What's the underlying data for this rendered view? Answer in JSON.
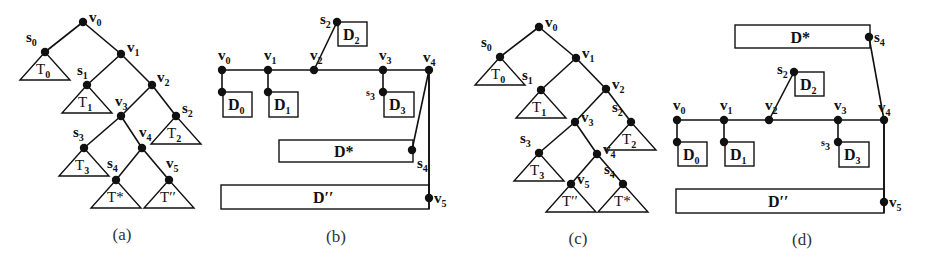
{
  "figure": {
    "panels": [
      {
        "id": "a",
        "type": "tree",
        "caption": "(a)",
        "nodes": [
          {
            "id": "v0",
            "label": "v",
            "sub": "0",
            "x": 83,
            "y": 22,
            "lx": 89,
            "ly": 22
          },
          {
            "id": "s0",
            "label": "s",
            "sub": "0",
            "x": 45,
            "y": 52,
            "lx": 26,
            "ly": 42
          },
          {
            "id": "v1",
            "label": "v",
            "sub": "1",
            "x": 121,
            "y": 54,
            "lx": 127,
            "ly": 52
          },
          {
            "id": "s1",
            "label": "s",
            "sub": "1",
            "x": 87,
            "y": 85,
            "lx": 77,
            "ly": 75
          },
          {
            "id": "v2",
            "label": "v",
            "sub": "2",
            "x": 152,
            "y": 85,
            "lx": 157,
            "ly": 82
          },
          {
            "id": "v3",
            "label": "v",
            "sub": "3",
            "x": 121,
            "y": 116,
            "lx": 115,
            "ly": 106
          },
          {
            "id": "s2",
            "label": "s",
            "sub": "2",
            "x": 176,
            "y": 116,
            "lx": 182,
            "ly": 113
          },
          {
            "id": "s3",
            "label": "s",
            "sub": "3",
            "x": 84,
            "y": 148,
            "lx": 73,
            "ly": 137
          },
          {
            "id": "v4",
            "label": "v",
            "sub": "4",
            "x": 142,
            "y": 148,
            "lx": 139,
            "ly": 137
          },
          {
            "id": "s4",
            "label": "s",
            "sub": "4",
            "x": 116,
            "y": 180,
            "lx": 107,
            "ly": 168
          },
          {
            "id": "v5",
            "label": "v",
            "sub": "5",
            "x": 169,
            "y": 180,
            "lx": 166,
            "ly": 168
          }
        ],
        "edges": [
          [
            "v0",
            "s0"
          ],
          [
            "v0",
            "v1"
          ],
          [
            "v1",
            "s1"
          ],
          [
            "v1",
            "v2"
          ],
          [
            "v2",
            "v3"
          ],
          [
            "v2",
            "s2"
          ],
          [
            "v3",
            "s3"
          ],
          [
            "v3",
            "v4"
          ],
          [
            "v4",
            "s4"
          ],
          [
            "v4",
            "v5"
          ]
        ],
        "subtrees": [
          {
            "root": "s0",
            "label": "T",
            "sub": "0"
          },
          {
            "root": "s1",
            "label": "T",
            "sub": "1"
          },
          {
            "root": "s2",
            "label": "T",
            "sub": "2"
          },
          {
            "root": "s3",
            "label": "T",
            "sub": "3"
          },
          {
            "root": "s4",
            "label": "T*",
            "sub": ""
          },
          {
            "root": "v5",
            "label": "T′′",
            "sub": ""
          }
        ],
        "caption_pos": {
          "x": 122,
          "y": 240
        }
      },
      {
        "id": "b",
        "type": "path-layout",
        "caption": "(b)",
        "spine_y": 70,
        "spine": [
          {
            "id": "v0",
            "label": "v",
            "sub": "0",
            "x": 222
          },
          {
            "id": "v1",
            "label": "v",
            "sub": "1",
            "x": 268
          },
          {
            "id": "v2",
            "label": "v",
            "sub": "2",
            "x": 314
          },
          {
            "id": "v3",
            "label": "v",
            "sub": "3",
            "x": 383
          },
          {
            "id": "v4",
            "label": "v",
            "sub": "4",
            "x": 429
          }
        ],
        "small_boxes": [
          {
            "label": "D",
            "sub": "0",
            "attach": {
              "x": 222,
              "y": 92
            },
            "x": 223,
            "y": 92,
            "w": 29,
            "h": 25,
            "node_label": ""
          },
          {
            "label": "D",
            "sub": "1",
            "attach": {
              "x": 268,
              "y": 92
            },
            "x": 269,
            "y": 92,
            "w": 29,
            "h": 25,
            "node_label": ""
          },
          {
            "label": "D",
            "sub": "3",
            "attach": {
              "x": 383,
              "y": 92
            },
            "x": 384,
            "y": 92,
            "w": 30,
            "h": 25,
            "node_label": "s3"
          },
          {
            "label": "D",
            "sub": "2",
            "attach": {
              "x": 337,
              "y": 22
            },
            "x": 338,
            "y": 22,
            "w": 29,
            "h": 24,
            "node_label": "s2"
          }
        ],
        "wide_boxes": [
          {
            "label": "D*",
            "x": 279,
            "y": 140,
            "w": 134,
            "h": 22,
            "node": {
              "label": "s",
              "sub": "4",
              "x": 412,
              "y": 150
            }
          },
          {
            "label": "D′′",
            "x": 221,
            "y": 185,
            "w": 208,
            "h": 24,
            "node": {
              "label": "v",
              "sub": "5",
              "x": 429,
              "y": 198
            }
          }
        ],
        "caption_pos": {
          "x": 336,
          "y": 242
        }
      },
      {
        "id": "c",
        "type": "tree",
        "caption": "(c)",
        "nodes": [
          {
            "id": "v0",
            "label": "v",
            "sub": "0",
            "x": 539,
            "y": 27
          },
          {
            "id": "s0",
            "label": "s",
            "sub": "0",
            "x": 500,
            "y": 57
          },
          {
            "id": "v1",
            "label": "v",
            "sub": "1",
            "x": 576,
            "y": 58
          },
          {
            "id": "s1",
            "label": "s",
            "sub": "1",
            "x": 541,
            "y": 90
          },
          {
            "id": "v2",
            "label": "v",
            "sub": "2",
            "x": 606,
            "y": 89
          },
          {
            "id": "v3",
            "label": "v",
            "sub": "3",
            "x": 575,
            "y": 122
          },
          {
            "id": "s2",
            "label": "s",
            "sub": "2",
            "x": 631,
            "y": 122
          },
          {
            "id": "s3",
            "label": "s",
            "sub": "3",
            "x": 539,
            "y": 153
          },
          {
            "id": "v4",
            "label": "v",
            "sub": "4",
            "x": 597,
            "y": 154
          },
          {
            "id": "v5",
            "label": "v",
            "sub": "5",
            "x": 571,
            "y": 184
          },
          {
            "id": "s4",
            "label": "s",
            "sub": "4",
            "x": 623,
            "y": 184
          }
        ],
        "edges": [
          [
            "v0",
            "s0"
          ],
          [
            "v0",
            "v1"
          ],
          [
            "v1",
            "s1"
          ],
          [
            "v1",
            "v2"
          ],
          [
            "v2",
            "v3"
          ],
          [
            "v2",
            "s2"
          ],
          [
            "v3",
            "s3"
          ],
          [
            "v3",
            "v4"
          ],
          [
            "v4",
            "v5"
          ],
          [
            "v4",
            "s4"
          ]
        ],
        "subtrees": [
          {
            "root": "s0",
            "label": "T",
            "sub": "0"
          },
          {
            "root": "s1",
            "label": "T",
            "sub": "1"
          },
          {
            "root": "s2",
            "label": "T",
            "sub": "2"
          },
          {
            "root": "s3",
            "label": "T",
            "sub": "3"
          },
          {
            "root": "v5",
            "label": "T′′",
            "sub": ""
          },
          {
            "root": "s4",
            "label": "T*",
            "sub": ""
          }
        ],
        "caption_pos": {
          "x": 578,
          "y": 244
        }
      },
      {
        "id": "d",
        "type": "path-layout",
        "caption": "(d)",
        "spine_y": 120,
        "spine": [
          {
            "id": "v0",
            "label": "v",
            "sub": "0",
            "x": 677
          },
          {
            "id": "v1",
            "label": "v",
            "sub": "1",
            "x": 724
          },
          {
            "id": "v2",
            "label": "v",
            "sub": "2",
            "x": 769
          },
          {
            "id": "v3",
            "label": "v",
            "sub": "3",
            "x": 838
          },
          {
            "id": "v4",
            "label": "v",
            "sub": "4",
            "x": 884
          }
        ],
        "small_boxes": [
          {
            "label": "D",
            "sub": "0",
            "attach": {
              "x": 677,
              "y": 142
            },
            "x": 678,
            "y": 142,
            "w": 29,
            "h": 24,
            "node_label": ""
          },
          {
            "label": "D",
            "sub": "1",
            "attach": {
              "x": 724,
              "y": 142
            },
            "x": 725,
            "y": 142,
            "w": 29,
            "h": 24,
            "node_label": ""
          },
          {
            "label": "D",
            "sub": "3",
            "attach": {
              "x": 838,
              "y": 142
            },
            "x": 839,
            "y": 142,
            "w": 30,
            "h": 25,
            "node_label": "s3"
          },
          {
            "label": "D",
            "sub": "2",
            "attach": {
              "x": 794,
              "y": 72
            },
            "x": 795,
            "y": 72,
            "w": 29,
            "h": 24,
            "node_label": "s2"
          }
        ],
        "wide_boxes": [
          {
            "label": "D*",
            "x": 735,
            "y": 25,
            "w": 135,
            "h": 23,
            "node": {
              "label": "s",
              "sub": "4",
              "x": 869,
              "y": 37
            }
          },
          {
            "label": "D′′",
            "x": 676,
            "y": 189,
            "w": 208,
            "h": 24,
            "node": {
              "label": "v",
              "sub": "5",
              "x": 884,
              "y": 202
            }
          }
        ],
        "caption_pos": {
          "x": 802,
          "y": 245
        }
      }
    ]
  },
  "colors": {
    "stroke": "#111111",
    "background": "#ffffff",
    "caption": "#333333"
  }
}
